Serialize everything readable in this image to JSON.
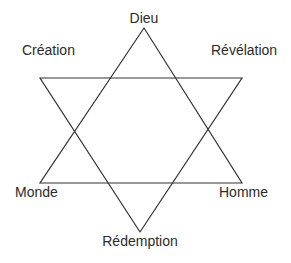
{
  "diagram": {
    "title": "",
    "stroke_color": "#333333",
    "text_color": "#2b2b2b",
    "background": "#ffffff",
    "labels": {
      "top": "Dieu",
      "upper_left": "Création",
      "upper_right": "Révélation",
      "lower_left": "Monde",
      "lower_right": "Homme",
      "bottom": "Rédemption"
    },
    "triangles": [
      {
        "name": "upward",
        "points": [
          [
            144,
            28
          ],
          [
            40,
            183
          ],
          [
            242,
            183
          ]
        ]
      },
      {
        "name": "downward",
        "points": [
          [
            40,
            78
          ],
          [
            242,
            78
          ],
          [
            140,
            232
          ]
        ]
      }
    ]
  }
}
